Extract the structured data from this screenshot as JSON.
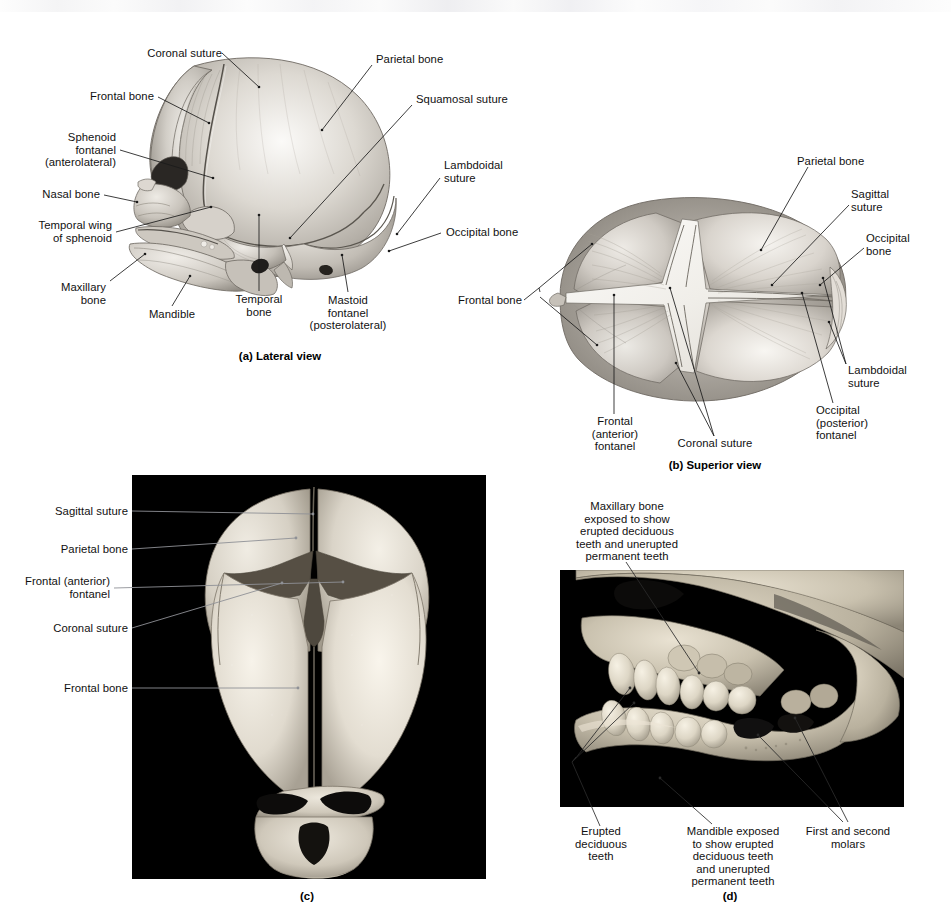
{
  "figure": {
    "panels": [
      {
        "id": "a",
        "caption": "(a) Lateral view",
        "type": "illustration",
        "labels": [
          "Coronal suture",
          "Frontal bone",
          "Sphenoid\nfontanel\n(anterolateral)",
          "Nasal bone",
          "Temporal wing\nof sphenoid",
          "Maxillary\nbone",
          "Mandible",
          "Temporal\nbone",
          "Mastoid\nfontanel\n(posterolateral)",
          "Parietal bone",
          "Squamosal suture",
          "Lambdoidal\nsuture",
          "Occipital bone"
        ]
      },
      {
        "id": "b",
        "caption": "(b) Superior view",
        "type": "illustration",
        "labels": [
          "Parietal bone",
          "Sagittal\nsuture",
          "Occipital\nbone",
          "Lambdoidal\nsuture",
          "Occipital\n(posterior)\nfontanel",
          "Coronal suture",
          "Frontal\n(anterior)\nfontanel",
          "Frontal bone"
        ]
      },
      {
        "id": "c",
        "caption": "(c)",
        "type": "photograph",
        "labels": [
          "Sagittal suture",
          "Parietal bone",
          "Frontal (anterior)\nfontanel",
          "Coronal suture",
          "Frontal bone"
        ]
      },
      {
        "id": "d",
        "caption": "(d)",
        "type": "photograph",
        "labels": [
          "Maxillary bone\nexposed to show\nerupted deciduous\nteeth and unerupted\npermanent teeth",
          "Erupted\ndeciduous\nteeth",
          "Mandible exposed\nto show erupted\ndeciduous teeth\nand unerupted\npermanent teeth",
          "First and second\nmolars"
        ]
      }
    ]
  },
  "panel_a": {
    "caption": "(a) Lateral view",
    "coronal_suture": "Coronal suture",
    "frontal_bone": "Frontal bone",
    "sphenoid_fontanel": "Sphenoid\nfontanel\n(anterolateral)",
    "nasal_bone": "Nasal bone",
    "temporal_wing": "Temporal wing\nof sphenoid",
    "maxillary_bone": "Maxillary\nbone",
    "mandible": "Mandible",
    "temporal_bone": "Temporal\nbone",
    "mastoid_fontanel": "Mastoid\nfontanel\n(posterolateral)",
    "parietal_bone": "Parietal bone",
    "squamosal_suture": "Squamosal suture",
    "lambdoidal_suture": "Lambdoidal\nsuture",
    "occipital_bone": "Occipital bone"
  },
  "panel_b": {
    "caption": "(b) Superior view",
    "parietal_bone": "Parietal bone",
    "sagittal_suture": "Sagittal\nsuture",
    "occipital_bone": "Occipital\nbone",
    "lambdoidal_suture": "Lambdoidal\nsuture",
    "occipital_fontanel": "Occipital\n(posterior)\nfontanel",
    "coronal_suture": "Coronal suture",
    "frontal_fontanel": "Frontal\n(anterior)\nfontanel",
    "frontal_bone": "Frontal bone"
  },
  "panel_c": {
    "caption": "(c)",
    "sagittal_suture": "Sagittal suture",
    "parietal_bone": "Parietal bone",
    "frontal_fontanel": "Frontal (anterior)\nfontanel",
    "coronal_suture": "Coronal suture",
    "frontal_bone": "Frontal bone"
  },
  "panel_d": {
    "caption": "(d)",
    "maxillary_note": "Maxillary bone\nexposed to show\nerupted deciduous\nteeth and unerupted\npermanent teeth",
    "erupted_deciduous": "Erupted\ndeciduous\nteeth",
    "mandible_note": "Mandible exposed\nto show erupted\ndeciduous teeth\nand unerupted\npermanent teeth",
    "molars": "First and second\nmolars"
  },
  "colors": {
    "page_background": "#ffffff",
    "text": "#111111",
    "leader_line": "#1a1a1a",
    "photo_leader_c": "#8f9196",
    "photo_plate_background": "#000000",
    "bone_light": "#f2f0ec",
    "bone_mid": "#c9c5bf",
    "bone_shadow": "#8e8a84",
    "suture_line": "#3a3833"
  }
}
